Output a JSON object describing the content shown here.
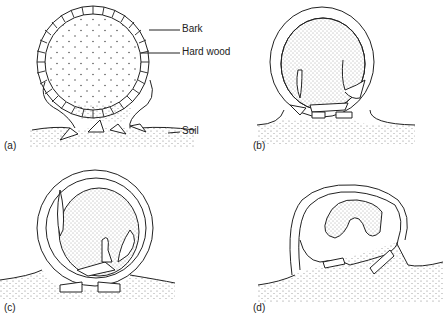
{
  "figure": {
    "type": "diagram",
    "panels": [
      {
        "id": "a",
        "label": "(a)",
        "annotations": [
          "Bark",
          "Hard wood",
          "Soil"
        ]
      },
      {
        "id": "b",
        "label": "(b)"
      },
      {
        "id": "c",
        "label": "(c)"
      },
      {
        "id": "d",
        "label": "(d)"
      }
    ]
  },
  "labels": {
    "bark": "Bark",
    "hardwood": "Hard wood",
    "soil": "Soil",
    "a": "(a)",
    "b": "(b)",
    "c": "(c)",
    "d": "(d)"
  },
  "colors": {
    "ink": "#222222",
    "background": "#ffffff"
  }
}
